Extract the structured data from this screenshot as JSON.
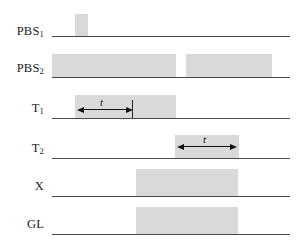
{
  "figure": {
    "type": "timing-diagram",
    "title": "",
    "width": 302,
    "height": 241,
    "colors": {
      "pulse_fill": "#d9d9d9",
      "baseline": "#4a4a4a",
      "text": "#1b1b1b",
      "arrow": "#111111",
      "background": "#ffffff"
    }
  },
  "rows": [
    {
      "id": "pbs1",
      "label_main": "PBS",
      "label_sub": "1",
      "label_full": "PBS₁",
      "baseline": {
        "x": 52,
        "width": 238,
        "y": 36
      },
      "pulses": [
        {
          "x": 75,
          "width": 13,
          "y": 14,
          "height": 22
        }
      ],
      "annotations": []
    },
    {
      "id": "pbs2",
      "label_main": "PBS",
      "label_sub": "2",
      "label_full": "PBS₂",
      "baseline": {
        "x": 52,
        "width": 238,
        "y": 77
      },
      "pulses": [
        {
          "x": 52,
          "width": 124,
          "y": 54,
          "height": 23
        },
        {
          "x": 186,
          "width": 86,
          "y": 54,
          "height": 23
        }
      ],
      "annotations": []
    },
    {
      "id": "t1",
      "label_main": "T",
      "label_sub": "1",
      "label_full": "T₁",
      "baseline": {
        "x": 52,
        "width": 238,
        "y": 118
      },
      "pulses": [
        {
          "x": 75,
          "width": 101,
          "y": 95,
          "height": 23
        }
      ],
      "annotations": [
        {
          "kind": "double-arrow",
          "label": "t",
          "x_start": 77,
          "x_end": 132,
          "y": 109,
          "label_x": 100,
          "label_y": 96,
          "tick": {
            "x": 132,
            "y": 100,
            "height": 18
          }
        }
      ]
    },
    {
      "id": "t2",
      "label_main": "T",
      "label_sub": "2",
      "label_full": "T₂",
      "baseline": {
        "x": 52,
        "width": 238,
        "y": 158
      },
      "pulses": [
        {
          "x": 175,
          "width": 64,
          "y": 135,
          "height": 23
        }
      ],
      "annotations": [
        {
          "kind": "double-arrow",
          "label": "t",
          "x_start": 177,
          "x_end": 237,
          "y": 146,
          "label_x": 203,
          "label_y": 133,
          "tick": null
        }
      ]
    },
    {
      "id": "x",
      "label_main": "X",
      "label_sub": "",
      "label_full": "X",
      "baseline": {
        "x": 52,
        "width": 238,
        "y": 196
      },
      "pulses": [
        {
          "x": 136,
          "width": 102,
          "y": 169,
          "height": 27
        }
      ],
      "annotations": []
    },
    {
      "id": "gl",
      "label_main": "GL",
      "label_sub": "",
      "label_full": "GL",
      "baseline": {
        "x": 52,
        "width": 238,
        "y": 234
      },
      "pulses": [
        {
          "x": 136,
          "width": 102,
          "y": 207,
          "height": 27
        }
      ],
      "annotations": []
    }
  ]
}
